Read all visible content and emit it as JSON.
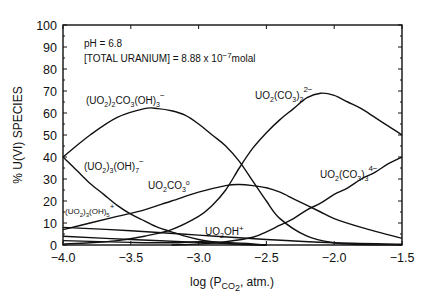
{
  "chart_data": {
    "type": "line",
    "title": "",
    "xlabel": "log (P_CO2, atm.)",
    "ylabel": "% U(VI) SPECIES",
    "xlim": [
      -4.0,
      -1.5
    ],
    "ylim": [
      0,
      100
    ],
    "x_ticks": [
      "-4.0",
      "-3.5",
      "-3.0",
      "-2.5",
      "-2.0",
      "-1.5"
    ],
    "y_ticks": [
      "0",
      "10",
      "20",
      "30",
      "40",
      "50",
      "60",
      "70",
      "80",
      "90",
      "100"
    ],
    "grid": false,
    "annotations": {
      "ph": "pH = 6.8",
      "total_uranium": "[TOTAL URANIUM] = 8.88 x 10⁻⁷ molal"
    },
    "series": [
      {
        "name": "(UO2)2CO3(OH)3-",
        "label": "(UO₂)₂CO₃(OH)₃⁻",
        "x": [
          -4.0,
          -3.8,
          -3.6,
          -3.4,
          -3.3,
          -3.2,
          -3.1,
          -3.0,
          -2.9,
          -2.8,
          -2.7,
          -2.6,
          -2.5,
          -2.4,
          -2.2,
          -2.0,
          -1.8,
          -1.5
        ],
        "y": [
          40,
          50,
          58,
          62,
          62,
          61,
          59,
          55,
          50,
          45,
          38,
          29,
          20,
          12,
          4,
          1,
          0.2,
          0
        ]
      },
      {
        "name": "UO2(CO3)2 2-",
        "label": "UO₂(CO₃)₂²⁻",
        "x": [
          -4.0,
          -3.8,
          -3.6,
          -3.4,
          -3.2,
          -3.0,
          -2.9,
          -2.8,
          -2.7,
          -2.6,
          -2.5,
          -2.4,
          -2.3,
          -2.2,
          -2.1,
          -2.0,
          -1.9,
          -1.8,
          -1.7,
          -1.6,
          -1.5
        ],
        "y": [
          0.5,
          1,
          2,
          4,
          7,
          13,
          18,
          25,
          35,
          44,
          51,
          57,
          62,
          67,
          69,
          68,
          65,
          62,
          58,
          54,
          50
        ]
      },
      {
        "name": "(UO2)3(OH)7-",
        "label": "(UO₂)₃(OH)₇⁻",
        "x": [
          -4.0,
          -3.9,
          -3.8,
          -3.7,
          -3.6,
          -3.5,
          -3.4,
          -3.3,
          -3.2,
          -3.1,
          -3.0,
          -2.9,
          -2.8,
          -2.7,
          -2.5
        ],
        "y": [
          40,
          34,
          28,
          23,
          18,
          14,
          11,
          8,
          6,
          4,
          2.5,
          1.5,
          0.8,
          0.3,
          0
        ]
      },
      {
        "name": "UO2CO3 0",
        "label": "UO₂CO₃°",
        "x": [
          -4.0,
          -3.8,
          -3.6,
          -3.4,
          -3.2,
          -3.0,
          -2.8,
          -2.7,
          -2.6,
          -2.5,
          -2.4,
          -2.3,
          -2.2,
          -2.1,
          -2.0,
          -1.8,
          -1.5
        ],
        "y": [
          7,
          10,
          13,
          16,
          20,
          24,
          27,
          27.5,
          27,
          26,
          24,
          21,
          18,
          15,
          12,
          8,
          3
        ]
      },
      {
        "name": "UO2(CO3)3 4-",
        "label": "UO₂(CO₃)₃⁴⁻",
        "x": [
          -3.2,
          -3.0,
          -2.8,
          -2.6,
          -2.5,
          -2.4,
          -2.3,
          -2.2,
          -2.1,
          -2.0,
          -1.9,
          -1.8,
          -1.7,
          -1.6,
          -1.5
        ],
        "y": [
          0,
          0.5,
          1.5,
          3.5,
          6,
          9,
          12,
          16,
          19,
          23,
          26,
          30,
          33,
          37,
          40
        ]
      },
      {
        "name": "(UO2)3(OH)5+",
        "label": "(UO₂)₃(OH)₅⁺",
        "x": [
          -4.0,
          -3.5,
          -3.0,
          -2.5,
          -2.0,
          -1.5
        ],
        "y": [
          8,
          6.5,
          4.5,
          2.5,
          1,
          0.3
        ]
      },
      {
        "name": "UO2OH+",
        "label": "UO₂OH⁺",
        "x": [
          -4.0,
          -3.5,
          -3.0,
          -2.7,
          -2.5
        ],
        "y": [
          4,
          2.5,
          1.2,
          0.4,
          0
        ]
      },
      {
        "name": "minor species",
        "label": "",
        "x": [
          -4.0,
          -3.5,
          -3.2,
          -3.0,
          -2.8,
          -2.6,
          -2.5
        ],
        "y": [
          2,
          1.2,
          1,
          1.5,
          1.2,
          0.5,
          0
        ]
      }
    ]
  },
  "labels": {
    "ph": "pH = 6.8",
    "total_uranium_prefix": "[TOTAL URANIUM] = 8.88 x 10",
    "total_uranium_exp": "−7",
    "total_uranium_unit": "molal",
    "ylabel": "% U(VI) SPECIES",
    "xlabel_pre": "log (P",
    "xlabel_sub": "CO",
    "xlabel_sub2": "2",
    "xlabel_post": ", atm.)",
    "species": {
      "s1": {
        "a": "(UO",
        "b": "2",
        "c": ")",
        "d": "2",
        "e": "CO",
        "f": "3",
        "g": "(OH)",
        "h": "3",
        "sup": "−"
      },
      "s2": {
        "a": "UO",
        "b": "2",
        "c": "(CO",
        "d": "3",
        "e": ")",
        "f": "2",
        "sup": "2−"
      },
      "s3": {
        "a": "(UO",
        "b": "2",
        "c": ")",
        "d": "3",
        "e": "(OH)",
        "f": "7",
        "sup": "−"
      },
      "s4": {
        "a": "UO",
        "b": "2",
        "c": "CO",
        "d": "3",
        "sup": "o"
      },
      "s5": {
        "a": "UO",
        "b": "2",
        "c": "(CO",
        "d": "3",
        "e": ")",
        "f": "3",
        "sup": "4−"
      },
      "s6": {
        "a": "(UO",
        "b": "2",
        "c": ")",
        "d": "3",
        "e": "(OH)",
        "f": "5",
        "sup": "+"
      },
      "s7": {
        "a": "UO",
        "b": "2",
        "c": "OH",
        "sup": "+"
      }
    },
    "x_ticks": [
      "−4.0",
      "−3.5",
      "−3.0",
      "−2.5",
      "−2.0",
      "−1.5"
    ],
    "y_ticks": [
      "0",
      "10",
      "20",
      "30",
      "40",
      "50",
      "60",
      "70",
      "80",
      "90",
      "100"
    ]
  }
}
